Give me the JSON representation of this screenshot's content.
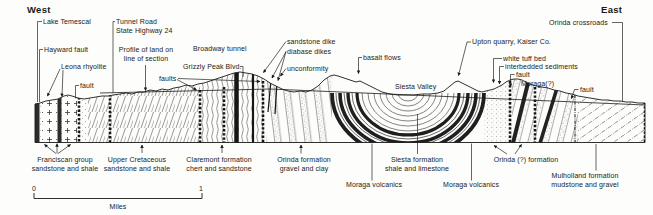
{
  "title_west": "West",
  "title_east": "East",
  "annotations": {
    "lake_temescal": "Lake Temescal",
    "tunnel_road": "Tunnel Road\nState Highway 24",
    "orinda_crossroads": "Orinda crossroads",
    "hayward_fault": "Hayward fault",
    "profile_note": "Profile of land on\nline of section",
    "broadway_tunnel": "Broadway tunnel",
    "upton_quarry": "Upton quarry, Kaiser Co.",
    "leona_rhyolite": "Leona rhyolite",
    "sandstone_dike": "sandstone dike",
    "diabase_dikes": "diabase dikes",
    "basalt_flows": "basalt flows",
    "white_tuff_bed": "white tuff bed",
    "grizzly_peak_blvd": "Grizzly Peak Blvd.",
    "interbedded_sediments": "interbedded sediments",
    "unconformity": "unconformity",
    "fault_west": "fault",
    "faults": "faults",
    "fault_center": "fault",
    "moraga_query": "Moraga(?)",
    "fault_east": "fault",
    "siesta_valley": "Siesta Valley"
  },
  "formations": {
    "franciscan": "Franciscan group\nsandstone and shale",
    "upper_cretaceous": "Upper Cretaceous\nsandstone and shale",
    "claremont": "Claremont formation\nchert and sandstone",
    "orinda": "Orinda formation\ngravel and clay",
    "siesta": "Siesta formation\nshale and limestone",
    "moraga_west": "Moraga volcanics",
    "moraga_east": "Moraga volcanics",
    "orinda_query": "Orinda (?) formation",
    "mulholland": "Mulholland formation\nmudstone and gravel"
  },
  "scale_bar": {
    "start": "0",
    "end": "1",
    "unit": "Miles"
  },
  "colors": {
    "ink": "#1a1a1a",
    "paper": "#fdfdfb"
  }
}
